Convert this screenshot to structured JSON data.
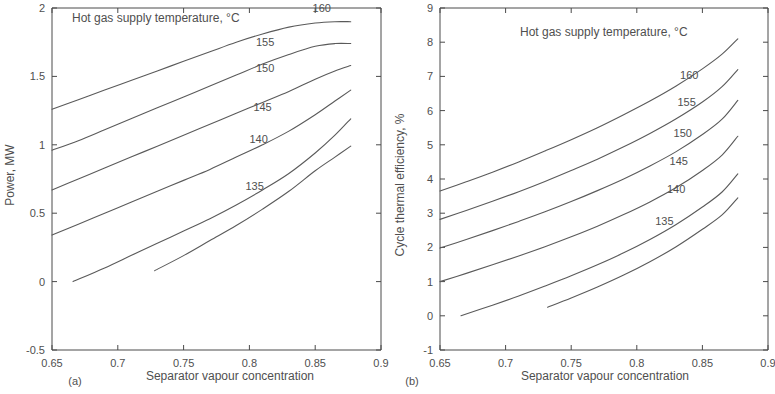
{
  "figure": {
    "background": "#ffffff",
    "line_color": "#5a5a5a",
    "axis_color": "#4a4a4a",
    "text_color": "#4f4f4f"
  },
  "panels": [
    {
      "caption": "(a)",
      "legend_title": "Hot gas supply temperature, °C",
      "xlabel": "Separator vapour concentration",
      "ylabel": "Power, MW",
      "xticks": [
        "0.65",
        "0.7",
        "0.75",
        "0.8",
        "0.85",
        "0.9"
      ],
      "yticks": [
        "-0.5",
        "0",
        "0.5",
        "1",
        "1.5",
        "2"
      ],
      "series_labels": [
        "160",
        "155",
        "150",
        "145",
        "140",
        "135"
      ]
    },
    {
      "caption": "(b)",
      "legend_title": "Hot gas supply temperature, °C",
      "xlabel": "Separator vapour concentration",
      "ylabel": "Cycle thermal efficiency, %",
      "xticks": [
        "0.65",
        "0.7",
        "0.75",
        "0.8",
        "0.85",
        "0.9"
      ],
      "yticks": [
        "-1",
        "0",
        "1",
        "2",
        "3",
        "4",
        "5",
        "6",
        "7",
        "8",
        "9"
      ],
      "series_labels": [
        "160",
        "155",
        "150",
        "145",
        "140",
        "135"
      ]
    }
  ],
  "chart_data": [
    {
      "type": "line",
      "panel": "(a)",
      "title": "Hot gas supply temperature, °C",
      "xlabel": "Separator vapour concentration",
      "ylabel": "Power, MW",
      "xlim": [
        0.65,
        0.9
      ],
      "ylim": [
        -0.5,
        2.0
      ],
      "xticks": [
        0.65,
        0.7,
        0.75,
        0.8,
        0.85,
        0.9
      ],
      "yticks": [
        -0.5,
        0,
        0.5,
        1.0,
        1.5,
        2.0
      ],
      "grid": false,
      "legend": "inline-curve-labels",
      "series": [
        {
          "name": "160",
          "x": [
            0.65,
            0.67,
            0.69,
            0.71,
            0.73,
            0.75,
            0.77,
            0.79,
            0.81,
            0.83,
            0.85,
            0.865,
            0.877
          ],
          "values": [
            1.26,
            1.33,
            1.4,
            1.47,
            1.54,
            1.61,
            1.68,
            1.75,
            1.81,
            1.86,
            1.89,
            1.9,
            1.9
          ]
        },
        {
          "name": "155",
          "x": [
            0.65,
            0.67,
            0.69,
            0.71,
            0.73,
            0.75,
            0.77,
            0.79,
            0.81,
            0.83,
            0.85,
            0.865,
            0.877
          ],
          "values": [
            0.96,
            1.03,
            1.11,
            1.19,
            1.27,
            1.35,
            1.43,
            1.51,
            1.59,
            1.66,
            1.72,
            1.74,
            1.74
          ]
        },
        {
          "name": "150",
          "x": [
            0.65,
            0.67,
            0.69,
            0.71,
            0.73,
            0.75,
            0.77,
            0.79,
            0.81,
            0.83,
            0.85,
            0.865,
            0.877
          ],
          "values": [
            0.67,
            0.75,
            0.83,
            0.91,
            0.99,
            1.07,
            1.15,
            1.23,
            1.31,
            1.39,
            1.48,
            1.54,
            1.58
          ]
        },
        {
          "name": "145",
          "x": [
            0.65,
            0.67,
            0.69,
            0.71,
            0.73,
            0.75,
            0.77,
            0.79,
            0.81,
            0.83,
            0.85,
            0.865,
            0.877
          ],
          "values": [
            0.34,
            0.42,
            0.5,
            0.58,
            0.66,
            0.74,
            0.82,
            0.91,
            1.0,
            1.1,
            1.22,
            1.32,
            1.4
          ]
        },
        {
          "name": "140",
          "x": [
            0.666,
            0.69,
            0.71,
            0.73,
            0.75,
            0.77,
            0.79,
            0.81,
            0.83,
            0.85,
            0.865,
            0.877
          ],
          "values": [
            0.0,
            0.1,
            0.19,
            0.28,
            0.37,
            0.46,
            0.56,
            0.67,
            0.79,
            0.94,
            1.07,
            1.19
          ]
        },
        {
          "name": "135",
          "x": [
            0.728,
            0.75,
            0.77,
            0.79,
            0.81,
            0.83,
            0.85,
            0.865,
            0.877
          ],
          "values": [
            0.08,
            0.19,
            0.3,
            0.41,
            0.53,
            0.66,
            0.81,
            0.91,
            0.99
          ]
        }
      ],
      "annotations": [
        {
          "text": "160",
          "x": 0.855,
          "y": 1.97
        },
        {
          "text": "155",
          "x": 0.812,
          "y": 1.72
        },
        {
          "text": "150",
          "x": 0.812,
          "y": 1.53
        },
        {
          "text": "145",
          "x": 0.81,
          "y": 1.25
        },
        {
          "text": "140",
          "x": 0.807,
          "y": 1.01
        },
        {
          "text": "135",
          "x": 0.804,
          "y": 0.67
        }
      ]
    },
    {
      "type": "line",
      "panel": "(b)",
      "title": "Hot gas supply temperature, °C",
      "xlabel": "Separator vapour concentration",
      "ylabel": "Cycle thermal efficiency, %",
      "xlim": [
        0.65,
        0.9
      ],
      "ylim": [
        -1,
        9
      ],
      "xticks": [
        0.65,
        0.7,
        0.75,
        0.8,
        0.85,
        0.9
      ],
      "yticks": [
        -1,
        0,
        1,
        2,
        3,
        4,
        5,
        6,
        7,
        8,
        9
      ],
      "grid": false,
      "legend": "inline-curve-labels",
      "series": [
        {
          "name": "160",
          "x": [
            0.65,
            0.67,
            0.69,
            0.71,
            0.73,
            0.75,
            0.77,
            0.79,
            0.81,
            0.83,
            0.85,
            0.865,
            0.877
          ],
          "values": [
            3.65,
            3.92,
            4.2,
            4.5,
            4.82,
            5.15,
            5.5,
            5.88,
            6.28,
            6.72,
            7.22,
            7.65,
            8.1
          ]
        },
        {
          "name": "155",
          "x": [
            0.65,
            0.67,
            0.69,
            0.71,
            0.73,
            0.75,
            0.77,
            0.79,
            0.81,
            0.83,
            0.85,
            0.865,
            0.877
          ],
          "values": [
            2.82,
            3.08,
            3.35,
            3.63,
            3.93,
            4.25,
            4.58,
            4.94,
            5.33,
            5.76,
            6.25,
            6.7,
            7.2
          ]
        },
        {
          "name": "150",
          "x": [
            0.65,
            0.67,
            0.69,
            0.71,
            0.73,
            0.75,
            0.77,
            0.79,
            0.81,
            0.83,
            0.85,
            0.865,
            0.877
          ],
          "values": [
            1.98,
            2.23,
            2.49,
            2.76,
            3.04,
            3.34,
            3.66,
            4.0,
            4.38,
            4.8,
            5.3,
            5.75,
            6.3
          ]
        },
        {
          "name": "145",
          "x": [
            0.65,
            0.67,
            0.69,
            0.71,
            0.73,
            0.75,
            0.77,
            0.79,
            0.81,
            0.83,
            0.85,
            0.865,
            0.877
          ],
          "values": [
            1.0,
            1.24,
            1.49,
            1.75,
            2.02,
            2.31,
            2.62,
            2.96,
            3.33,
            3.75,
            4.25,
            4.7,
            5.25
          ]
        },
        {
          "name": "140",
          "x": [
            0.666,
            0.69,
            0.71,
            0.73,
            0.75,
            0.77,
            0.79,
            0.81,
            0.83,
            0.85,
            0.865,
            0.877
          ],
          "values": [
            0.0,
            0.31,
            0.58,
            0.87,
            1.17,
            1.49,
            1.84,
            2.23,
            2.67,
            3.18,
            3.62,
            4.15
          ]
        },
        {
          "name": "135",
          "x": [
            0.732,
            0.75,
            0.77,
            0.79,
            0.81,
            0.83,
            0.85,
            0.865,
            0.877
          ],
          "values": [
            0.25,
            0.52,
            0.84,
            1.19,
            1.58,
            2.02,
            2.53,
            2.95,
            3.45
          ]
        }
      ],
      "annotations": [
        {
          "text": "160",
          "x": 0.84,
          "y": 6.92
        },
        {
          "text": "155",
          "x": 0.838,
          "y": 6.12
        },
        {
          "text": "150",
          "x": 0.835,
          "y": 5.22
        },
        {
          "text": "145",
          "x": 0.832,
          "y": 4.42
        },
        {
          "text": "140",
          "x": 0.83,
          "y": 3.58
        },
        {
          "text": "135",
          "x": 0.821,
          "y": 2.65
        }
      ]
    }
  ]
}
